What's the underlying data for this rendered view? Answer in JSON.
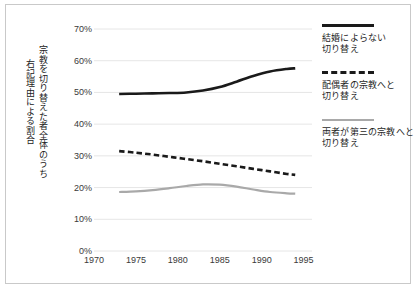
{
  "axis_titles": {
    "outer": "右記理由による割合",
    "inner": "宗教を切り替えた者全体のうち"
  },
  "legend": {
    "entries": [
      {
        "label_line1": "結婚によらない",
        "label_line2": "切り替え",
        "swatch": "solid-black-line-icon"
      },
      {
        "label_line1": "配偶者の宗教へと",
        "label_line2": "切り替え",
        "swatch": "dashed-black-line-icon"
      },
      {
        "label_line1": "両者が第三の宗教へと",
        "label_line2": "切り替え",
        "swatch": "solid-gray-line-icon"
      }
    ]
  },
  "ytick_labels": [
    "70%",
    "60%",
    "50%",
    "40%",
    "30%",
    "20%",
    "10%",
    "0%"
  ],
  "xtick_labels": [
    "1970",
    "1975",
    "1980",
    "1985",
    "1990",
    "1995"
  ],
  "colors": {
    "series_solid": "#1a1a1a",
    "series_dashed": "#1a1a1a",
    "series_gray": "#a9a9a9",
    "gridline": "#e6e6e6",
    "frame": "#c9c9c9",
    "text": "#222222"
  },
  "chart_data": {
    "type": "line",
    "title": "",
    "xlabel": "",
    "ylabel": "右記理由による割合 / 宗教を切り替えた者全体のうち",
    "xlim": [
      1970,
      1996
    ],
    "ylim": [
      0,
      70
    ],
    "ytick_values": [
      0,
      10,
      20,
      30,
      40,
      50,
      60,
      70
    ],
    "xtick_values": [
      1970,
      1975,
      1980,
      1985,
      1990,
      1995
    ],
    "grid": true,
    "legend_position": "right",
    "y_unit": "percent",
    "series": [
      {
        "name": "結婚によらない切り替え",
        "style": "solid",
        "color": "#1a1a1a",
        "x": [
          1973,
          1975,
          1977,
          1979,
          1981,
          1983,
          1985,
          1987,
          1989,
          1991,
          1993,
          1994
        ],
        "values": [
          49.5,
          49.6,
          49.7,
          49.8,
          50.0,
          50.6,
          51.7,
          53.4,
          55.2,
          56.6,
          57.4,
          57.6
        ]
      },
      {
        "name": "配偶者の宗教へと切り替え",
        "style": "dashed",
        "color": "#1a1a1a",
        "x": [
          1973,
          1975,
          1977,
          1979,
          1981,
          1983,
          1985,
          1987,
          1989,
          1991,
          1993,
          1994
        ],
        "values": [
          31.5,
          31.0,
          30.4,
          29.7,
          29.0,
          28.3,
          27.5,
          26.7,
          25.9,
          25.1,
          24.3,
          24.0
        ]
      },
      {
        "name": "両者が第三の宗教へと切り替え",
        "style": "solid",
        "color": "#a9a9a9",
        "x": [
          1973,
          1975,
          1977,
          1979,
          1981,
          1983,
          1985,
          1987,
          1989,
          1991,
          1993,
          1994
        ],
        "values": [
          18.6,
          18.8,
          19.2,
          19.8,
          20.5,
          21.0,
          20.9,
          20.3,
          19.4,
          18.6,
          18.2,
          18.1
        ]
      }
    ]
  }
}
